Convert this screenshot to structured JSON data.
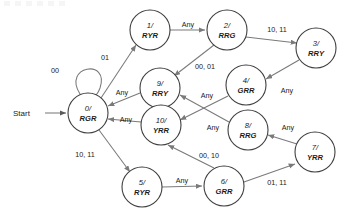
{
  "diagram": {
    "type": "finite-state-machine",
    "start_label": "Start",
    "node_radius": 20,
    "states": [
      {
        "key": "s0",
        "id": "0/",
        "output": "RGR",
        "cx": 88,
        "cy": 113
      },
      {
        "key": "s1",
        "id": "1/",
        "output": "RYR",
        "cx": 150,
        "cy": 30
      },
      {
        "key": "s2",
        "id": "2/",
        "output": "RRG",
        "cx": 227,
        "cy": 30
      },
      {
        "key": "s3",
        "id": "3/",
        "output": "RRY",
        "cx": 316,
        "cy": 48
      },
      {
        "key": "s4",
        "id": "4/",
        "output": "GRR",
        "cx": 246,
        "cy": 85
      },
      {
        "key": "s5",
        "id": "5/",
        "output": "RYR",
        "cx": 142,
        "cy": 187
      },
      {
        "key": "s6",
        "id": "6/",
        "output": "GRR",
        "cx": 224,
        "cy": 186
      },
      {
        "key": "s7",
        "id": "7/",
        "output": "YRR",
        "cx": 315,
        "cy": 152
      },
      {
        "key": "s8",
        "id": "8/",
        "output": "RRG",
        "cx": 248,
        "cy": 130
      },
      {
        "key": "s9",
        "id": "9/",
        "output": "RRY",
        "cx": 160,
        "cy": 88
      },
      {
        "key": "s10",
        "id": "10/",
        "output": "YRR",
        "cx": 161,
        "cy": 125
      }
    ],
    "transitions": [
      {
        "from": "s0",
        "to": "s0",
        "label": "00",
        "label_x": 55,
        "label_y": 70
      },
      {
        "from": "s0",
        "to": "s1",
        "label": "01",
        "label_x": 105,
        "label_y": 57
      },
      {
        "from": "s1",
        "to": "s2",
        "label": "Any",
        "label_x": 188,
        "label_y": 24
      },
      {
        "from": "s2",
        "to": "s3",
        "label": "10, 11",
        "label_x": 277,
        "label_y": 29
      },
      {
        "from": "s2",
        "to": "s9",
        "label": "00, 01",
        "label_x": 205,
        "label_y": 66
      },
      {
        "from": "s3",
        "to": "s4",
        "label": "Any",
        "label_x": 287,
        "label_y": 90
      },
      {
        "from": "s4",
        "to": "s10",
        "label": "Any",
        "label_x": 207,
        "label_y": 95
      },
      {
        "from": "s8",
        "to": "s9",
        "label": "Any",
        "label_x": 213,
        "label_y": 127
      },
      {
        "from": "s7",
        "to": "s8",
        "label": "Any",
        "label_x": 288,
        "label_y": 127
      },
      {
        "from": "s9",
        "to": "s0",
        "label": "Any",
        "label_x": 122,
        "label_y": 92
      },
      {
        "from": "s10",
        "to": "s0",
        "label": "Any",
        "label_x": 126,
        "label_y": 119
      },
      {
        "from": "s0",
        "to": "s5",
        "label": "10, 11",
        "label_x": 85,
        "label_y": 154
      },
      {
        "from": "s5",
        "to": "s6",
        "label": "Any",
        "label_x": 182,
        "label_y": 180
      },
      {
        "from": "s6",
        "to": "s10",
        "label": "00, 10",
        "label_x": 209,
        "label_y": 155
      },
      {
        "from": "s6",
        "to": "s7",
        "label": "01, 11",
        "label_x": 277,
        "label_y": 182
      }
    ]
  }
}
